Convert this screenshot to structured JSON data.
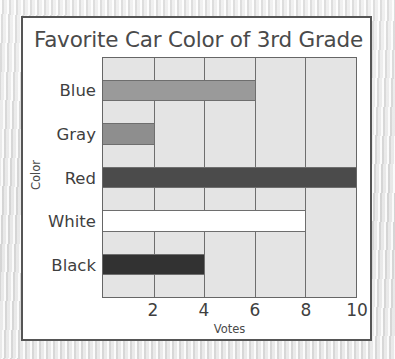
{
  "card": {
    "title": "Favorite Car Color of 3rd Grade"
  },
  "axes": {
    "x_title": "Votes",
    "y_title": "Color",
    "x_ticks": [
      "2",
      "4",
      "6",
      "8",
      "10"
    ]
  },
  "colors": {
    "plot_background": "#e4e4e4",
    "card_background": "#ffffff",
    "card_border": "#555555",
    "grid": "#6e6e6e",
    "text": "#3f3f3f",
    "bar_blue": "#9a9a9a",
    "bar_gray": "#8e8e8e",
    "bar_red": "#4b4b4b",
    "bar_white": "#ffffff",
    "bar_black": "#323232"
  },
  "chart_data": {
    "type": "bar",
    "orientation": "horizontal",
    "title": "Favorite Car Color of 3rd Grade",
    "xlabel": "Votes",
    "ylabel": "Color",
    "categories": [
      "Blue",
      "Gray",
      "Red",
      "White",
      "Black"
    ],
    "values": [
      6,
      2,
      10,
      8,
      4
    ],
    "bar_colors": [
      "#9a9a9a",
      "#8e8e8e",
      "#4b4b4b",
      "#ffffff",
      "#323232"
    ],
    "xlim": [
      0,
      10
    ],
    "xticks": [
      2,
      4,
      6,
      8,
      10
    ],
    "grid": true,
    "legend": false
  }
}
